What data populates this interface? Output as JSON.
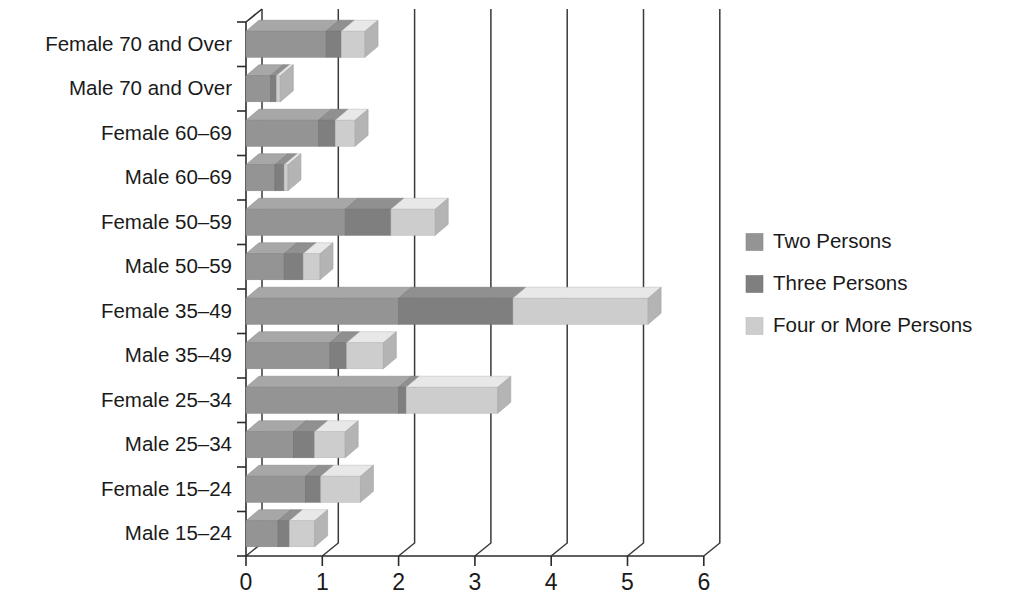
{
  "chart_data": {
    "type": "bar",
    "orientation": "horizontal",
    "stacked": true,
    "style": "3d-perspective",
    "title": "",
    "subtitle": "",
    "xlabel": "",
    "ylabel": "",
    "xlim": [
      0,
      6
    ],
    "xticks": [
      0,
      1,
      2,
      3,
      4,
      5,
      6
    ],
    "xtick_labels": [
      "0",
      "1",
      "2",
      "3",
      "4",
      "5",
      "6"
    ],
    "grid": true,
    "grid_axis": "x",
    "legend_position": "right",
    "categories": [
      "Female 70 and Over",
      "Male 70 and Over",
      "Female 60–69",
      "Male 60–69",
      "Female 50–59",
      "Male 50–59",
      "Female 35–49",
      "Male 35–49",
      "Female 25–34",
      "Male 25–34",
      "Female 15–24",
      "Male 15–24"
    ],
    "series": [
      {
        "name": "Two Persons",
        "color": "#949494",
        "values": [
          1.05,
          0.32,
          0.95,
          0.38,
          1.3,
          0.5,
          2.0,
          1.1,
          2.0,
          0.62,
          0.78,
          0.42
        ]
      },
      {
        "name": "Three Persons",
        "color": "#7f7f7f",
        "values": [
          0.2,
          0.08,
          0.22,
          0.12,
          0.6,
          0.25,
          1.5,
          0.22,
          0.1,
          0.28,
          0.2,
          0.15
        ]
      },
      {
        "name": "Four or More Persons",
        "color": "#cdcdcd",
        "values": [
          0.31,
          0.05,
          0.26,
          0.05,
          0.58,
          0.22,
          1.77,
          0.48,
          1.2,
          0.4,
          0.52,
          0.33
        ]
      }
    ],
    "totals": [
      1.56,
      0.45,
      1.43,
      0.55,
      2.48,
      0.97,
      5.27,
      1.8,
      3.3,
      1.3,
      1.5,
      0.9
    ]
  },
  "legend": {
    "items": [
      {
        "label": "Two Persons",
        "color": "#949494"
      },
      {
        "label": "Three Persons",
        "color": "#7f7f7f"
      },
      {
        "label": "Four or More Persons",
        "color": "#cdcdcd"
      }
    ]
  },
  "axis": {
    "x_tick_labels": [
      "0",
      "1",
      "2",
      "3",
      "4",
      "5",
      "6"
    ],
    "category_labels": [
      "Female 70 and Over",
      "Male 70 and Over",
      "Female 60–69",
      "Male 60–69",
      "Female 50–59",
      "Male 50–59",
      "Female 35–49",
      "Male 35–49",
      "Female 25–34",
      "Male 25–34",
      "Female 15–24",
      "Male 15–24"
    ]
  },
  "colors": {
    "two_persons": "#949494",
    "three_persons": "#7f7f7f",
    "four_or_more_persons": "#cdcdcd",
    "axis": "#2b2b2b",
    "background": "#ffffff",
    "text": "#1a1a1a"
  }
}
